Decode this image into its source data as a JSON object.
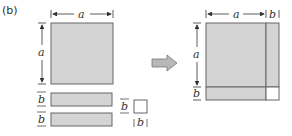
{
  "panel_label": "(b)",
  "colors": {
    "fill": "#d4d4d4",
    "stroke": "#666666",
    "empty_fill": "#ffffff",
    "arrow_fill": "#b8b8b8"
  },
  "left": {
    "square": {
      "side_label_top": "a",
      "side_label_left": "a"
    },
    "bars": [
      {
        "label": "b"
      },
      {
        "label": "b"
      }
    ],
    "small_square": {
      "label_left": "b",
      "label_bottom": "b"
    }
  },
  "arrow": {
    "direction": "right"
  },
  "right": {
    "top_labels": {
      "a": "a",
      "b": "b"
    },
    "left_labels": {
      "a": "a",
      "b": "b"
    }
  }
}
